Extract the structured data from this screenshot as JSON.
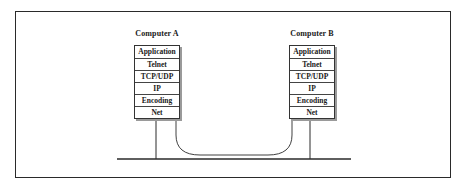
{
  "diagram": {
    "hosts": [
      {
        "label": "Computer A",
        "layers": [
          "Application",
          "Telnet",
          "TCP/UDP",
          "IP",
          "Encoding",
          "Net"
        ]
      },
      {
        "label": "Computer B",
        "layers": [
          "Application",
          "Telnet",
          "TCP/UDP",
          "IP",
          "Encoding",
          "Net"
        ]
      }
    ],
    "connections": [
      {
        "type": "network-bus",
        "description": "Horizontal network line linking both Net layers"
      },
      {
        "type": "virtual-link",
        "description": "Curved line connecting the Telnet-to-Net layer stacks of A and B"
      }
    ],
    "colors": {
      "line": "#2a2a2a",
      "shadow": "#9a9a9a",
      "background": "#ffffff"
    }
  }
}
